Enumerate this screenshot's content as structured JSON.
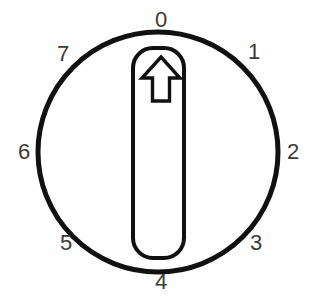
{
  "widget": {
    "name": "rotary-selector-knob",
    "title": "Rotary selector knob with 8 positions",
    "background_color": "#fefefe",
    "line_color": "#111111",
    "label_color": "#3a3a3a"
  },
  "dial": {
    "center_x": 158,
    "center_y": 152,
    "radius": 120,
    "stroke_width": 5,
    "position_count": 8,
    "selected_position": "0"
  },
  "pointer": {
    "shape": "rounded-rectangle",
    "x": 133,
    "y": 48,
    "width": 51,
    "height": 210,
    "corner_radius": 20,
    "stroke_width": 4,
    "arrow_direction": "up"
  },
  "labels": [
    {
      "text": "0",
      "x": 161,
      "y": 20,
      "angle_deg": 0
    },
    {
      "text": "1",
      "x": 254,
      "y": 52,
      "angle_deg": 45
    },
    {
      "text": "2",
      "x": 293,
      "y": 152,
      "angle_deg": 90
    },
    {
      "text": "3",
      "x": 256,
      "y": 243,
      "angle_deg": 135
    },
    {
      "text": "4",
      "x": 161,
      "y": 282,
      "angle_deg": 180
    },
    {
      "text": "5",
      "x": 66,
      "y": 243,
      "angle_deg": 225
    },
    {
      "text": "6",
      "x": 24,
      "y": 152,
      "angle_deg": 270
    },
    {
      "text": "7",
      "x": 63,
      "y": 54,
      "angle_deg": 315
    }
  ]
}
